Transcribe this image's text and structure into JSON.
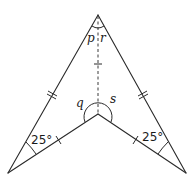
{
  "diagram": {
    "labels": {
      "apex_left": "p",
      "apex_right": "r",
      "inner_left": "q",
      "inner_right": "s",
      "bottom_left_angle": "25°",
      "bottom_right_angle": "25°"
    },
    "markings": {
      "outer_sides": "double tick (equal length)",
      "inner_sides": "single tick (equal length)",
      "dashed_segment": "single tick (equal length)"
    }
  }
}
